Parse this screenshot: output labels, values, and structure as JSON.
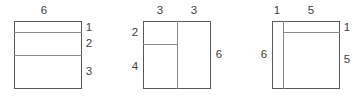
{
  "diagram": {
    "stroke_color": "#595959",
    "inner_stroke_color": "#8a8a8a",
    "label_color": "#3d3d3d",
    "background": "#ffffff",
    "figures": [
      {
        "id": "figure-1",
        "description": "Square divided by two horizontal lines into three bands",
        "box": {
          "x": 14,
          "y": 21,
          "w": 68,
          "h": 68
        },
        "total_width": 6,
        "total_height": 6,
        "dividers": [
          {
            "orientation": "horizontal",
            "offset_units": 1
          },
          {
            "orientation": "horizontal",
            "offset_units": 3
          }
        ],
        "labels": [
          {
            "name": "top-width-label",
            "text": "6",
            "x": 44,
            "y": 11
          },
          {
            "name": "right-band-1-label",
            "text": "1",
            "x": 89,
            "y": 28
          },
          {
            "name": "right-band-2-label",
            "text": "2",
            "x": 89,
            "y": 44
          },
          {
            "name": "right-band-3-label",
            "text": "3",
            "x": 89,
            "y": 72
          }
        ]
      },
      {
        "id": "figure-2",
        "description": "Square split vertically in half, left half split horizontally",
        "box": {
          "x": 143,
          "y": 21,
          "w": 68,
          "h": 68
        },
        "total_width": 6,
        "total_height": 6,
        "dividers": [
          {
            "orientation": "vertical",
            "offset_units": 3
          },
          {
            "orientation": "horizontal-partial",
            "offset_units": 2,
            "from_units": 0,
            "to_units": 3
          }
        ],
        "labels": [
          {
            "name": "top-left-width-label",
            "text": "3",
            "x": 160,
            "y": 11
          },
          {
            "name": "top-right-width-label",
            "text": "3",
            "x": 194,
            "y": 11
          },
          {
            "name": "left-upper-height-label",
            "text": "2",
            "x": 135,
            "y": 33
          },
          {
            "name": "left-lower-height-label",
            "text": "4",
            "x": 135,
            "y": 67
          },
          {
            "name": "right-height-label",
            "text": "6",
            "x": 219,
            "y": 55
          }
        ]
      },
      {
        "id": "figure-3",
        "description": "Square with a narrow left strip and a top strip on the remainder",
        "box": {
          "x": 272,
          "y": 21,
          "w": 68,
          "h": 68
        },
        "total_width": 6,
        "total_height": 6,
        "dividers": [
          {
            "orientation": "vertical",
            "offset_units": 1
          },
          {
            "orientation": "horizontal-partial",
            "offset_units": 1,
            "from_units": 1,
            "to_units": 6
          }
        ],
        "labels": [
          {
            "name": "top-left-width-label",
            "text": "1",
            "x": 277,
            "y": 11
          },
          {
            "name": "top-right-width-label",
            "text": "5",
            "x": 311,
            "y": 11
          },
          {
            "name": "left-height-label",
            "text": "6",
            "x": 264,
            "y": 55
          },
          {
            "name": "right-upper-height-label",
            "text": "1",
            "x": 347,
            "y": 28
          },
          {
            "name": "right-lower-height-label",
            "text": "5",
            "x": 347,
            "y": 60
          }
        ]
      }
    ]
  }
}
